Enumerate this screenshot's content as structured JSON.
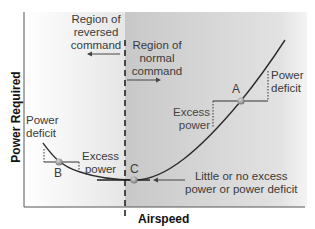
{
  "axes": {
    "y_label": "Power Required",
    "x_label": "Airspeed"
  },
  "regions": {
    "reversed": "Region of reversed command",
    "reversed_lines": [
      "Region of",
      "reversed",
      "command"
    ],
    "normal": "Region of normal command",
    "normal_lines": [
      "Region of",
      "normal",
      "command"
    ]
  },
  "points": {
    "a": "A",
    "b": "B",
    "c": "C"
  },
  "annotations": {
    "power_deficit_left": [
      "Power",
      "deficit"
    ],
    "excess_power_mid": [
      "Excess",
      "power"
    ],
    "excess_power_right": [
      "Excess",
      "power"
    ],
    "power_deficit_right": [
      "Power",
      "deficit"
    ],
    "little_or_none": [
      "Little or no excess",
      "power or power deficit"
    ]
  },
  "colors": {
    "reversed_bg": "#f2f2f2",
    "normal_bg": "#d4d4d4",
    "curve": "#2e2e2e",
    "text": "#3a3a3a"
  }
}
